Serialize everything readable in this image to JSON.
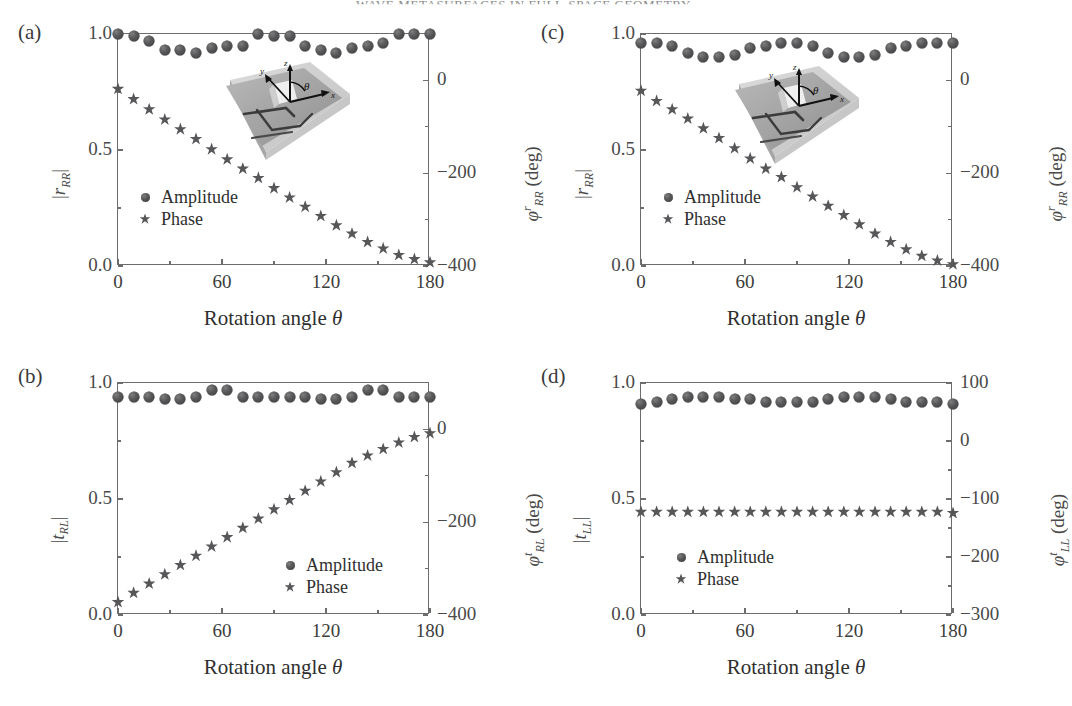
{
  "running_head": "WAVE METASURFACES IN FULL-SPACE GEOMETRY",
  "figure": {
    "panels": [
      {
        "id": "a",
        "label": "(a)",
        "xlabel_prefix": "Rotation angle ",
        "xlabel_symbol": "θ",
        "xlim": [
          0,
          180
        ],
        "xticks": [
          0,
          60,
          120,
          180
        ],
        "xtick_labels": [
          "0",
          "60",
          "120",
          "180"
        ],
        "left_axis": {
          "label_base": "r",
          "label_sub": "RR",
          "label_text": "|r_RR|",
          "ylim": [
            0.0,
            1.0
          ],
          "yticks": [
            0.0,
            0.5,
            1.0
          ],
          "ytick_labels": [
            "0.0",
            "0.5",
            "1.0"
          ]
        },
        "right_axis": {
          "label_symbol": "φ",
          "label_sup": "r",
          "label_sub": "RR",
          "label_units": "(deg)",
          "ylim": [
            -400,
            100
          ],
          "yticks": [
            0,
            -200,
            -400
          ],
          "ytick_labels": [
            "0",
            "−200",
            "−400"
          ],
          "minor_yticks": [
            -100,
            -300
          ]
        },
        "legend": [
          {
            "marker": "dot",
            "label": "Amplitude"
          },
          {
            "marker": "star",
            "label": "Phase"
          }
        ],
        "has_inset": true,
        "chart_data": {
          "type": "scatter",
          "x": [
            0,
            9,
            18,
            27,
            36,
            45,
            54,
            63,
            72,
            81,
            90,
            99,
            108,
            117,
            126,
            135,
            144,
            153,
            162,
            171,
            180
          ],
          "series": [
            {
              "name": "Amplitude",
              "marker": "dot",
              "axis": "left",
              "values": [
                1.0,
                0.99,
                0.97,
                0.93,
                0.93,
                0.92,
                0.94,
                0.95,
                0.95,
                1.0,
                0.99,
                0.99,
                0.95,
                0.93,
                0.92,
                0.94,
                0.95,
                0.96,
                1.0,
                1.0,
                1.0
              ]
            },
            {
              "name": "Phase",
              "marker": "star",
              "axis": "right",
              "values": [
                -18,
                -40,
                -62,
                -84,
                -105,
                -126,
                -148,
                -170,
                -190,
                -210,
                -232,
                -252,
                -272,
                -292,
                -312,
                -330,
                -348,
                -362,
                -376,
                -385,
                -392
              ]
            }
          ]
        }
      },
      {
        "id": "b",
        "label": "(b)",
        "xlabel_prefix": "Rotation angle ",
        "xlabel_symbol": "θ",
        "xlim": [
          0,
          180
        ],
        "xticks": [
          0,
          60,
          120,
          180
        ],
        "xtick_labels": [
          "0",
          "60",
          "120",
          "180"
        ],
        "left_axis": {
          "label_base": "t",
          "label_sub": "RL",
          "label_text": "|t_RL|",
          "ylim": [
            0.0,
            1.0
          ],
          "yticks": [
            0.0,
            0.5,
            1.0
          ],
          "ytick_labels": [
            "0.0",
            "0.5",
            "1.0"
          ]
        },
        "right_axis": {
          "label_symbol": "φ",
          "label_sup": "t",
          "label_sub": "RL",
          "label_units": "(deg)",
          "ylim": [
            -400,
            100
          ],
          "yticks": [
            0,
            -200,
            -400
          ],
          "ytick_labels": [
            "0",
            "−200",
            "−400"
          ],
          "minor_yticks": [
            -100,
            -300
          ]
        },
        "legend": [
          {
            "marker": "dot",
            "label": "Amplitude"
          },
          {
            "marker": "star",
            "label": "Phase"
          }
        ],
        "has_inset": false,
        "chart_data": {
          "type": "scatter",
          "x": [
            0,
            9,
            18,
            27,
            36,
            45,
            54,
            63,
            72,
            81,
            90,
            99,
            108,
            117,
            126,
            135,
            144,
            153,
            162,
            171,
            180
          ],
          "series": [
            {
              "name": "Amplitude",
              "marker": "dot",
              "axis": "left",
              "values": [
                0.94,
                0.94,
                0.94,
                0.93,
                0.93,
                0.94,
                0.97,
                0.97,
                0.94,
                0.94,
                0.94,
                0.94,
                0.94,
                0.93,
                0.93,
                0.94,
                0.97,
                0.97,
                0.94,
                0.94,
                0.94
              ]
            },
            {
              "name": "Phase",
              "marker": "star",
              "axis": "right",
              "values": [
                -372,
                -352,
                -332,
                -312,
                -292,
                -272,
                -252,
                -232,
                -212,
                -192,
                -172,
                -152,
                -132,
                -112,
                -92,
                -72,
                -56,
                -42,
                -28,
                -16,
                -8
              ]
            }
          ]
        }
      },
      {
        "id": "c",
        "label": "(c)",
        "xlabel_prefix": "Rotation angle ",
        "xlabel_symbol": "θ",
        "xlim": [
          0,
          180
        ],
        "xticks": [
          0,
          60,
          120,
          180
        ],
        "xtick_labels": [
          "0",
          "60",
          "120",
          "180"
        ],
        "left_axis": {
          "label_base": "r",
          "label_sub": "RR",
          "label_text": "|r_RR|",
          "ylim": [
            0.0,
            1.0
          ],
          "yticks": [
            0.0,
            0.5,
            1.0
          ],
          "ytick_labels": [
            "0.0",
            "0.5",
            "1.0"
          ]
        },
        "right_axis": {
          "label_symbol": "φ",
          "label_sup": "r",
          "label_sub": "RR",
          "label_units": "(deg)",
          "ylim": [
            -400,
            100
          ],
          "yticks": [
            0,
            -200,
            -400
          ],
          "ytick_labels": [
            "0",
            "−200",
            "−400"
          ],
          "minor_yticks": [
            -100,
            -300
          ]
        },
        "legend": [
          {
            "marker": "dot",
            "label": "Amplitude"
          },
          {
            "marker": "star",
            "label": "Phase"
          }
        ],
        "has_inset": true,
        "chart_data": {
          "type": "scatter",
          "x": [
            0,
            9,
            18,
            27,
            36,
            45,
            54,
            63,
            72,
            81,
            90,
            99,
            108,
            117,
            126,
            135,
            144,
            153,
            162,
            171,
            180
          ],
          "series": [
            {
              "name": "Amplitude",
              "marker": "dot",
              "axis": "left",
              "values": [
                0.96,
                0.96,
                0.95,
                0.92,
                0.9,
                0.9,
                0.91,
                0.94,
                0.95,
                0.96,
                0.96,
                0.95,
                0.92,
                0.9,
                0.9,
                0.91,
                0.94,
                0.95,
                0.96,
                0.96,
                0.96
              ]
            },
            {
              "name": "Phase",
              "marker": "star",
              "axis": "right",
              "values": [
                -22,
                -44,
                -62,
                -82,
                -103,
                -124,
                -146,
                -168,
                -190,
                -208,
                -230,
                -250,
                -270,
                -290,
                -310,
                -330,
                -348,
                -364,
                -378,
                -388,
                -396
              ]
            }
          ]
        }
      },
      {
        "id": "d",
        "label": "(d)",
        "xlabel_prefix": "Rotation angle ",
        "xlabel_symbol": "θ",
        "xlim": [
          0,
          180
        ],
        "xticks": [
          0,
          60,
          120,
          180
        ],
        "xtick_labels": [
          "0",
          "60",
          "120",
          "180"
        ],
        "left_axis": {
          "label_base": "t",
          "label_sub": "LL",
          "label_text": "|t_LL|",
          "ylim": [
            0.0,
            1.0
          ],
          "yticks": [
            0.0,
            0.5,
            1.0
          ],
          "ytick_labels": [
            "0.0",
            "0.5",
            "1.0"
          ]
        },
        "right_axis": {
          "label_symbol": "φ",
          "label_sup": "t",
          "label_sub": "LL",
          "label_units": "(deg)",
          "ylim": [
            -300,
            100
          ],
          "yticks": [
            100,
            0,
            -100,
            -200,
            -300
          ],
          "ytick_labels": [
            "100",
            "0",
            "−100",
            "−200",
            "−300"
          ],
          "minor_yticks": [
            -50,
            -150,
            -250
          ]
        },
        "legend": [
          {
            "marker": "dot",
            "label": "Amplitude"
          },
          {
            "marker": "star",
            "label": "Phase"
          }
        ],
        "has_inset": false,
        "chart_data": {
          "type": "scatter",
          "x": [
            0,
            9,
            18,
            27,
            36,
            45,
            54,
            63,
            72,
            81,
            90,
            99,
            108,
            117,
            126,
            135,
            144,
            153,
            162,
            171,
            180
          ],
          "series": [
            {
              "name": "Amplitude",
              "marker": "dot",
              "axis": "left",
              "values": [
                0.91,
                0.92,
                0.93,
                0.94,
                0.94,
                0.94,
                0.93,
                0.93,
                0.92,
                0.92,
                0.92,
                0.92,
                0.93,
                0.94,
                0.94,
                0.94,
                0.93,
                0.92,
                0.92,
                0.92,
                0.91
              ]
            },
            {
              "name": "Phase",
              "marker": "star",
              "axis": "right",
              "values": [
                -122,
                -122,
                -122,
                -122,
                -122,
                -122,
                -122,
                -122,
                -122,
                -122,
                -122,
                -122,
                -122,
                -122,
                -122,
                -122,
                -122,
                -122,
                -122,
                -122,
                -124
              ]
            }
          ]
        }
      }
    ],
    "inset": {
      "axis_labels": {
        "x": "x",
        "y": "y",
        "z": "z",
        "angle": "θ"
      }
    }
  }
}
